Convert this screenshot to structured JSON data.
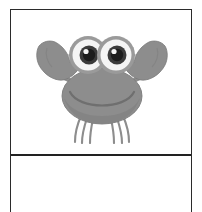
{
  "canvas": {
    "width": 202,
    "height": 212,
    "background": "#ffffff"
  },
  "frame": {
    "name": "bordered-table",
    "border_color": "#2b2b2b",
    "divider_color": "#222222",
    "rows": [
      {
        "name": "illustration-cell",
        "content_type": "image",
        "text": ""
      },
      {
        "name": "caption-cell",
        "content_type": "empty",
        "text": ""
      }
    ]
  },
  "illustration": {
    "name": "crab-illustration",
    "subject": "crab",
    "style": "grayscale cartoon clipart",
    "alt_text": "",
    "colors": {
      "body_fill": "#8d8d8d",
      "body_shade": "#7e7e7e",
      "outline": "#6f6f6f",
      "eye_white": "#f2f2f2",
      "eye_ring": "#9a9a9a",
      "pupil": "#3a3a3a",
      "pupil_core": "#1d1d1d",
      "highlight": "#ffffff",
      "leg_stroke": "#8d8d8d"
    },
    "parts": [
      {
        "name": "left-claw",
        "count": 1
      },
      {
        "name": "right-claw",
        "count": 1
      },
      {
        "name": "left-arm",
        "count": 1
      },
      {
        "name": "right-arm",
        "count": 1
      },
      {
        "name": "body-shell",
        "count": 1
      },
      {
        "name": "mouth-smile",
        "count": 1
      },
      {
        "name": "left-eye-stalk",
        "count": 1
      },
      {
        "name": "right-eye-stalk",
        "count": 1
      },
      {
        "name": "left-eye",
        "count": 1
      },
      {
        "name": "right-eye",
        "count": 1
      },
      {
        "name": "eyelashes",
        "count": 6
      },
      {
        "name": "legs",
        "count": 6
      }
    ]
  }
}
